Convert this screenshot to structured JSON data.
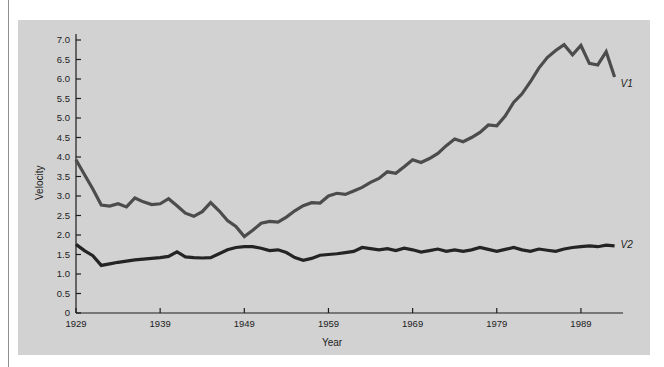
{
  "figure": {
    "background": "#d2d2d2",
    "page_background": "#ffffff"
  },
  "chart_data": {
    "type": "line",
    "title": "",
    "xlabel": "Year",
    "ylabel": "Velocity",
    "xlim": [
      1929,
      1994
    ],
    "ylim": [
      0,
      7.25
    ],
    "grid": false,
    "legend_position": "right-inline-labels",
    "xticks": [
      1929,
      1939,
      1949,
      1959,
      1969,
      1979,
      1989
    ],
    "xtick_labels": [
      "1929",
      "1939",
      "1949",
      "1959",
      "1969",
      "1979",
      "1989"
    ],
    "yticks": [
      0,
      0.5,
      1.0,
      1.5,
      2.0,
      2.5,
      3.0,
      3.5,
      4.0,
      4.5,
      5.0,
      5.5,
      6.0,
      6.5,
      7.0
    ],
    "ytick_labels": [
      "0",
      "0.5",
      "1.0",
      "1.5",
      "2.0",
      "2.5",
      "3.0",
      "3.5",
      "4.0",
      "4.5",
      "5.0",
      "5.5",
      "6.0",
      "6.5",
      "7.0"
    ],
    "x": [
      1929,
      1930,
      1931,
      1932,
      1933,
      1934,
      1935,
      1936,
      1937,
      1938,
      1939,
      1940,
      1941,
      1942,
      1943,
      1944,
      1945,
      1946,
      1947,
      1948,
      1949,
      1950,
      1951,
      1952,
      1953,
      1954,
      1955,
      1956,
      1957,
      1958,
      1959,
      1960,
      1961,
      1962,
      1963,
      1964,
      1965,
      1966,
      1967,
      1968,
      1969,
      1970,
      1971,
      1972,
      1973,
      1974,
      1975,
      1976,
      1977,
      1978,
      1979,
      1980,
      1981,
      1982,
      1983,
      1984,
      1985,
      1986,
      1987,
      1988,
      1989,
      1990,
      1991,
      1992,
      1993
    ],
    "series": [
      {
        "name": "V1",
        "label": "V1",
        "color": "#4c4c4c",
        "width": 3.2,
        "values": [
          3.93,
          3.55,
          3.18,
          2.77,
          2.74,
          2.8,
          2.72,
          2.95,
          2.85,
          2.78,
          2.8,
          2.93,
          2.75,
          2.56,
          2.48,
          2.6,
          2.83,
          2.62,
          2.37,
          2.22,
          1.96,
          2.12,
          2.3,
          2.35,
          2.33,
          2.46,
          2.62,
          2.75,
          2.83,
          2.82,
          3.0,
          3.07,
          3.04,
          3.13,
          3.22,
          3.35,
          3.45,
          3.62,
          3.58,
          3.75,
          3.93,
          3.86,
          3.96,
          4.09,
          4.29,
          4.46,
          4.39,
          4.5,
          4.63,
          4.82,
          4.8,
          5.05,
          5.4,
          5.62,
          5.93,
          6.28,
          6.55,
          6.73,
          6.88,
          6.62,
          6.86,
          6.4,
          6.36,
          6.7,
          6.05
        ]
      },
      {
        "name": "V2",
        "label": "V2",
        "color": "#242424",
        "width": 3.2,
        "values": [
          1.76,
          1.6,
          1.47,
          1.22,
          1.26,
          1.3,
          1.33,
          1.36,
          1.38,
          1.4,
          1.42,
          1.45,
          1.57,
          1.44,
          1.42,
          1.41,
          1.42,
          1.52,
          1.62,
          1.68,
          1.7,
          1.7,
          1.66,
          1.6,
          1.62,
          1.55,
          1.42,
          1.35,
          1.4,
          1.48,
          1.5,
          1.52,
          1.55,
          1.58,
          1.68,
          1.65,
          1.62,
          1.65,
          1.6,
          1.66,
          1.62,
          1.56,
          1.6,
          1.64,
          1.58,
          1.62,
          1.58,
          1.62,
          1.68,
          1.63,
          1.58,
          1.63,
          1.68,
          1.62,
          1.58,
          1.64,
          1.61,
          1.58,
          1.64,
          1.68,
          1.7,
          1.72,
          1.7,
          1.74,
          1.72
        ]
      }
    ]
  },
  "axes": {
    "y_axis_title": "Velocity",
    "x_axis_title": "Year"
  }
}
